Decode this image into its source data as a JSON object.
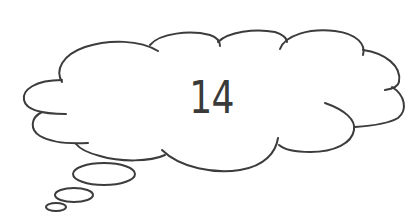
{
  "thought_bubble": {
    "text": "14",
    "stroke_color": "#3c3c3c",
    "fill_color": "#ffffff",
    "text_color": "#3a3a3a"
  }
}
